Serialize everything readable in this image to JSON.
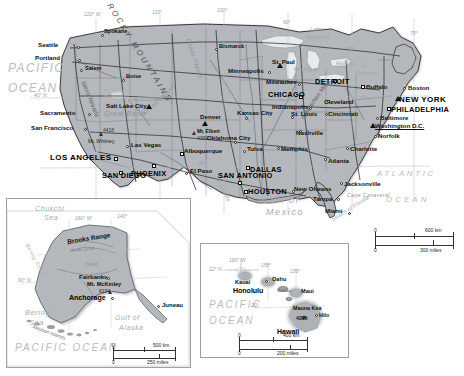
{
  "map": {
    "title": "United States reference map with Alaska and Hawaii insets",
    "background_color": "#ffffff",
    "land_color": "#b4b7bb",
    "water_label_color": "#b9bcc0",
    "border_color": "#3a3a3a"
  },
  "oceans": [
    {
      "name": "pacific-ocean-label",
      "line1": "PACIFIC",
      "line2": "OCEAN"
    },
    {
      "name": "atlantic-ocean-label",
      "line1": "ATLANTIC",
      "line2": "OCEAN"
    }
  ],
  "water_features": {
    "gulf_of_mexico_l1": "Gulf of",
    "gulf_of_mexico_l2": "Mexico",
    "lake_superior_l1": "Lake",
    "lake_superior_l2": "Superior",
    "lake_michigan_l1": "L.",
    "lake_michigan_l2": "Michigan",
    "lake_huron_l1": "L.",
    "lake_huron_l2": "Huron",
    "lake_ontario_l1": "L.",
    "lake_ontario_l2": "Ontario",
    "lake_erie": "L. Erie",
    "straits_of_florida": "Straits of Florida",
    "rio_grande": "Rio Grande"
  },
  "physical_features": {
    "rocky_mountains": "ROCKY MOUNTAINS",
    "great_plains": "Great Plains",
    "great_basin": "Great Basin",
    "great_salt_lake_l1": "Great",
    "great_salt_lake_l2": "Salt Lake",
    "sierra_nevada": "Sierra Nevada",
    "grand_canyon": "Grand Canyon",
    "appalachian_mts": "Appalachian Mts",
    "cape_canaveral": "Cape Canaveral"
  },
  "peaks": [
    {
      "name": "mt-whitney",
      "label": "Mt. Whitney",
      "elevation": "4418"
    },
    {
      "name": "mt-elbert",
      "label": "Mt. Elbert",
      "elevation": "4399"
    }
  ],
  "cities": [
    {
      "name": "seattle",
      "label": "Seattle",
      "size": "med"
    },
    {
      "name": "spokane",
      "label": "Spokane",
      "size": "small"
    },
    {
      "name": "portland",
      "label": "Portland",
      "size": "med"
    },
    {
      "name": "salem",
      "label": "Salem",
      "size": "small"
    },
    {
      "name": "boise",
      "label": "Boise",
      "size": "small"
    },
    {
      "name": "sacramento",
      "label": "Sacramento",
      "size": "med"
    },
    {
      "name": "san-francisco",
      "label": "San Francisco",
      "size": "med"
    },
    {
      "name": "salt-lake-city",
      "label": "Salt Lake City",
      "size": "med"
    },
    {
      "name": "las-vegas",
      "label": "Las Vegas",
      "size": "med"
    },
    {
      "name": "los-angeles",
      "label": "LOS ANGELES",
      "size": "xl"
    },
    {
      "name": "san-diego",
      "label": "SAN DIEGO",
      "size": "large"
    },
    {
      "name": "phoenix",
      "label": "PHOENIX",
      "size": "large"
    },
    {
      "name": "denver",
      "label": "Denver",
      "size": "med"
    },
    {
      "name": "albuquerque",
      "label": "Albuquerque",
      "size": "med"
    },
    {
      "name": "el-paso",
      "label": "El Paso",
      "size": "med"
    },
    {
      "name": "san-antonio",
      "label": "SAN ANTONIO",
      "size": "large"
    },
    {
      "name": "dallas",
      "label": "DALLAS",
      "size": "large"
    },
    {
      "name": "houston",
      "label": "HOUSTON",
      "size": "large"
    },
    {
      "name": "oklahoma-city",
      "label": "Oklahoma City",
      "size": "med"
    },
    {
      "name": "tulsa",
      "label": "Tulsa",
      "size": "med"
    },
    {
      "name": "kansas-city",
      "label": "Kansas City",
      "size": "med"
    },
    {
      "name": "bismarck",
      "label": "Bismarck",
      "size": "small"
    },
    {
      "name": "minneapolis",
      "label": "Minneapolis",
      "size": "med"
    },
    {
      "name": "st-paul",
      "label": "St. Paul",
      "size": "med"
    },
    {
      "name": "milwaukee",
      "label": "Milwaukee",
      "size": "med"
    },
    {
      "name": "chicago",
      "label": "CHICAGO",
      "size": "large"
    },
    {
      "name": "detroit",
      "label": "DETROIT",
      "size": "large"
    },
    {
      "name": "indianapolis",
      "label": "Indianapolis",
      "size": "med"
    },
    {
      "name": "st-louis",
      "label": "St. Louis",
      "size": "med"
    },
    {
      "name": "cincinnati",
      "label": "Cincinnati",
      "size": "med"
    },
    {
      "name": "cleveland",
      "label": "Cleveland",
      "size": "med"
    },
    {
      "name": "buffalo",
      "label": "Buffalo",
      "size": "med"
    },
    {
      "name": "boston",
      "label": "Boston",
      "size": "med"
    },
    {
      "name": "new-york",
      "label": "NEW YORK",
      "size": "xl"
    },
    {
      "name": "philadelphia",
      "label": "PHILADELPHIA",
      "size": "large"
    },
    {
      "name": "baltimore",
      "label": "Baltimore",
      "size": "med"
    },
    {
      "name": "washington-dc",
      "label": "Washington D.C.",
      "size": "med"
    },
    {
      "name": "norfolk",
      "label": "Norfolk",
      "size": "med"
    },
    {
      "name": "nashville",
      "label": "Nashville",
      "size": "med"
    },
    {
      "name": "memphis",
      "label": "Memphis",
      "size": "med"
    },
    {
      "name": "charlotte",
      "label": "Charlotte",
      "size": "med"
    },
    {
      "name": "atlanta",
      "label": "Atlanta",
      "size": "med"
    },
    {
      "name": "jacksonville",
      "label": "Jacksonville",
      "size": "med"
    },
    {
      "name": "new-orleans",
      "label": "New Orleans",
      "size": "med"
    },
    {
      "name": "tampa",
      "label": "Tampa",
      "size": "med"
    },
    {
      "name": "miami",
      "label": "Miami",
      "size": "med"
    }
  ],
  "graticule_main": {
    "lon": [
      "120° W",
      "110°",
      "100°",
      "90°",
      "80°",
      "70°"
    ],
    "lat": [
      "40° N",
      "30°"
    ]
  },
  "scale_main": {
    "name": "main-scale-bar",
    "km_zero": "0",
    "km_max": "600 km",
    "mi_zero": "0",
    "mi_max": "300 miles"
  },
  "alaska_inset": {
    "name": "alaska-inset",
    "seas": {
      "chukchi_l1": "Chukchi",
      "chukchi_l2": "Sea",
      "bering_l1": "Bering",
      "bering_l2": "Sea",
      "bering_strait": "Bering Strait",
      "gulf_l1": "Gulf of",
      "gulf_l2": "Alaska",
      "pacific": "PACIFIC OCEAN"
    },
    "features": {
      "brooks_range": "Brooks Range",
      "arctic_circle": "Arctic Circle",
      "yukon": "Yukon",
      "aleutian_islands": "Aleutian Islands"
    },
    "cities": [
      {
        "name": "fairbanks",
        "label": "Fairbanks"
      },
      {
        "name": "anchorage",
        "label": "Anchorage"
      },
      {
        "name": "juneau",
        "label": "Juneau"
      }
    ],
    "peak": {
      "label": "Mt. McKinley",
      "elevation": "6194"
    },
    "graticule": {
      "lon": [
        "160° W",
        "140°"
      ],
      "lat": [
        "60° N"
      ]
    },
    "scale": {
      "km_zero": "0",
      "km_max": "500 km",
      "mi_zero": "0",
      "mi_max": "250 miles"
    }
  },
  "hawaii_inset": {
    "name": "hawaii-inset",
    "ocean_l1": "PACIFIC",
    "ocean_l2": "OCEAN",
    "islands": [
      {
        "name": "kauai",
        "label": "Kauai"
      },
      {
        "name": "oahu",
        "label": "Oahu"
      },
      {
        "name": "maui",
        "label": "Maui"
      },
      {
        "name": "hawaii",
        "label": "Hawaii"
      },
      {
        "name": "molokai",
        "label": "Molokai"
      }
    ],
    "cities": [
      {
        "name": "honolulu",
        "label": "Honolulu"
      },
      {
        "name": "hilo",
        "label": "Hilo"
      }
    ],
    "peak": {
      "label": "Mauna Kea",
      "elevation": "4205"
    },
    "graticule": {
      "lon": [
        "160° W",
        "158°",
        "156°"
      ],
      "lat": [
        "22° N",
        "20°"
      ]
    },
    "scale": {
      "km_zero": "0",
      "km_max": "400 km",
      "mi_zero": "0",
      "mi_max": "200 miles"
    }
  }
}
